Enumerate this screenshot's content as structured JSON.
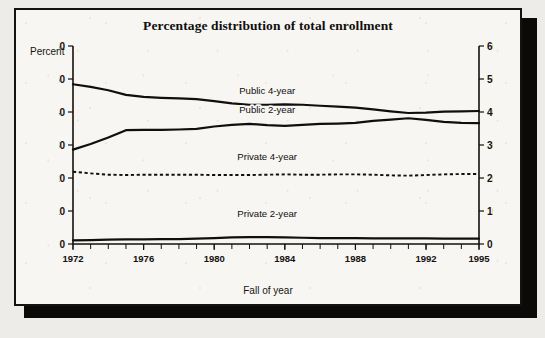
{
  "figure": {
    "title": "Percentage distribution of total enrollment",
    "y_axis_caption": "Percent",
    "x_axis_caption": "Fall of year"
  },
  "chart_data": {
    "type": "line",
    "title": "Percentage distribution of total enrollment",
    "xlabel": "Fall of year",
    "ylabel": "Percent",
    "xlim": [
      1972,
      1995
    ],
    "ylim": [
      0,
      60
    ],
    "yticks": [
      0,
      10,
      20,
      30,
      40,
      50,
      60
    ],
    "xticks": [
      1972,
      1976,
      1980,
      1984,
      1988,
      1992,
      1995
    ],
    "x_tick_labels": [
      "1972",
      "1976",
      "1980",
      "1984",
      "1988",
      "1992",
      "1995"
    ],
    "y_tick_labels": [
      "0",
      "10",
      "20",
      "30",
      "40",
      "50",
      "60"
    ],
    "right_axis_y_tick_labels": [
      "0",
      "10",
      "20",
      "30",
      "40",
      "50",
      "60"
    ],
    "grid": false,
    "legend_position": "inline-annotations",
    "x": [
      1972,
      1973,
      1974,
      1975,
      1976,
      1977,
      1978,
      1979,
      1980,
      1981,
      1982,
      1983,
      1984,
      1985,
      1986,
      1987,
      1988,
      1989,
      1990,
      1991,
      1992,
      1993,
      1994,
      1995
    ],
    "series": [
      {
        "name": "Public 4-year",
        "style": "solid",
        "color": "#100f0d",
        "values": [
          48.4,
          47.6,
          46.6,
          45.2,
          44.6,
          44.3,
          44.1,
          43.9,
          43.3,
          42.6,
          42.2,
          42.2,
          42.3,
          42.2,
          41.9,
          41.6,
          41.3,
          40.8,
          40.2,
          39.7,
          39.8,
          40.1,
          40.2,
          40.3
        ]
      },
      {
        "name": "Public 2-year",
        "style": "solid",
        "color": "#100f0d",
        "values": [
          28.6,
          30.3,
          32.3,
          34.5,
          34.6,
          34.6,
          34.7,
          34.9,
          35.6,
          36.1,
          36.4,
          36.0,
          35.8,
          36.1,
          36.4,
          36.5,
          36.7,
          37.3,
          37.7,
          38.1,
          37.6,
          37.0,
          36.7,
          36.6
        ]
      },
      {
        "name": "Private 4-year",
        "style": "dashed",
        "color": "#100f0d",
        "values": [
          21.9,
          21.4,
          21.0,
          20.9,
          21.0,
          21.0,
          21.0,
          21.0,
          20.9,
          20.9,
          20.9,
          21.0,
          21.1,
          21.0,
          21.0,
          21.1,
          21.1,
          21.0,
          20.8,
          20.7,
          20.9,
          21.1,
          21.2,
          21.2
        ]
      },
      {
        "name": "Private 2-year",
        "style": "solid",
        "color": "#100f0d",
        "values": [
          1.1,
          1.2,
          1.3,
          1.4,
          1.4,
          1.5,
          1.5,
          1.6,
          1.8,
          2.0,
          2.1,
          2.1,
          2.0,
          1.9,
          1.8,
          1.8,
          1.8,
          1.7,
          1.7,
          1.7,
          1.7,
          1.6,
          1.6,
          1.6
        ]
      }
    ],
    "annotations": [
      {
        "text": "Public 4-year",
        "x": 1983.0,
        "y": 45.5
      },
      {
        "text": "Public 2-year",
        "x": 1983.0,
        "y": 39.6
      },
      {
        "text": "Private 4-year",
        "x": 1983.0,
        "y": 25.6
      },
      {
        "text": "Private 2-year",
        "x": 1983.0,
        "y": 8.2
      }
    ]
  }
}
